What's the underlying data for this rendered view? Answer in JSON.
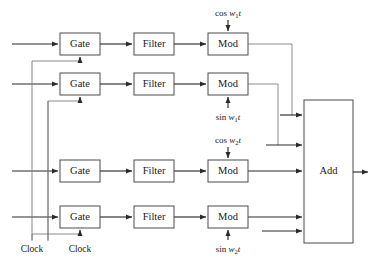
{
  "diagram": {
    "blocks": [
      {
        "id": "gate1",
        "label": "Gate",
        "x": 60,
        "y": 33,
        "w": 40,
        "h": 22
      },
      {
        "id": "filter1",
        "label": "Filter",
        "x": 134,
        "y": 33,
        "w": 40,
        "h": 22
      },
      {
        "id": "mod1",
        "label": "Mod",
        "x": 208,
        "y": 33,
        "w": 40,
        "h": 22
      },
      {
        "id": "gate2",
        "label": "Gate",
        "x": 60,
        "y": 73,
        "w": 40,
        "h": 22
      },
      {
        "id": "filter2",
        "label": "Filter",
        "x": 134,
        "y": 73,
        "w": 40,
        "h": 22
      },
      {
        "id": "mod2",
        "label": "Mod",
        "x": 208,
        "y": 73,
        "w": 40,
        "h": 22
      },
      {
        "id": "gate3",
        "label": "Gate",
        "x": 60,
        "y": 160,
        "w": 40,
        "h": 22
      },
      {
        "id": "filter3",
        "label": "Filter",
        "x": 134,
        "y": 160,
        "w": 40,
        "h": 22
      },
      {
        "id": "mod3",
        "label": "Mod",
        "x": 208,
        "y": 160,
        "w": 40,
        "h": 22
      },
      {
        "id": "gate4",
        "label": "Gate",
        "x": 60,
        "y": 206,
        "w": 40,
        "h": 22
      },
      {
        "id": "filter4",
        "label": "Filter",
        "x": 134,
        "y": 206,
        "w": 40,
        "h": 22
      },
      {
        "id": "mod4",
        "label": "Mod",
        "x": 208,
        "y": 206,
        "w": 40,
        "h": 22
      },
      {
        "id": "add",
        "label": "Add",
        "x": 304,
        "y": 100,
        "w": 49,
        "h": 143
      }
    ],
    "carriers": [
      {
        "id": "carrier1",
        "func": "cos",
        "var": "w",
        "sub": "1",
        "t": "t",
        "text": "cos w1t",
        "x": 228,
        "y": 16,
        "target": "mod1",
        "position": "above"
      },
      {
        "id": "carrier2",
        "func": "sin",
        "var": "w",
        "sub": "1",
        "t": "t",
        "text": "sin w1t",
        "x": 228,
        "y": 120,
        "target": "mod2",
        "position": "below"
      },
      {
        "id": "carrier3",
        "func": "cos",
        "var": "w",
        "sub": "2",
        "t": "t",
        "text": "cos w2t",
        "x": 228,
        "y": 143,
        "target": "mod3",
        "position": "above"
      },
      {
        "id": "carrier4",
        "func": "sin",
        "var": "w",
        "sub": "2",
        "t": "t",
        "text": "sin w2t",
        "x": 228,
        "y": 252,
        "target": "mod4",
        "position": "below"
      }
    ],
    "clocks": [
      {
        "id": "clock-left",
        "label": "Clock",
        "x": 32,
        "y": 248
      },
      {
        "id": "clock-right",
        "label": "Clock",
        "x": 80,
        "y": 248
      }
    ],
    "output": {
      "id": "output-arrow",
      "from": "add",
      "x": 353,
      "y": 172
    }
  }
}
